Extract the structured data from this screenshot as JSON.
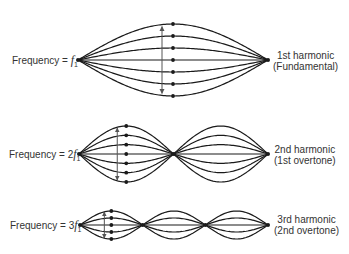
{
  "colors": {
    "string": "#1a1a1a",
    "arrow": "#555555",
    "text": "#333333"
  },
  "rows": [
    {
      "harmonic": 1,
      "freq_prefix": "Frequency = ",
      "freq_coef": "",
      "freq_symbol": "f",
      "freq_sub": "1",
      "name_line1": "1st harmonic",
      "name_line2": "(Fundamental)",
      "snapshot_count": 7
    },
    {
      "harmonic": 2,
      "freq_prefix": "Frequency = ",
      "freq_coef": "2",
      "freq_symbol": "f",
      "freq_sub": "1",
      "name_line1": "2nd harmonic",
      "name_line2": "(1st overtone)",
      "snapshot_count": 7
    },
    {
      "harmonic": 3,
      "freq_prefix": "Frequency = ",
      "freq_coef": "3",
      "freq_symbol": "f",
      "freq_sub": "1",
      "name_line1": "3rd harmonic",
      "name_line2": "(2nd overtone)",
      "snapshot_count": 5
    }
  ]
}
